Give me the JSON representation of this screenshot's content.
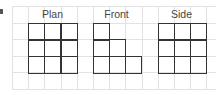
{
  "figure": {
    "marker": "i",
    "grid": {
      "columns": 12,
      "rows": 5,
      "cell_px": 16.2,
      "line_color": "#e2e2e2"
    },
    "views": [
      {
        "label": "Plan",
        "col_start": 1,
        "cells": [
          [
            0,
            0
          ],
          [
            1,
            0
          ],
          [
            2,
            0
          ],
          [
            0,
            1
          ],
          [
            1,
            1
          ],
          [
            2,
            1
          ],
          [
            0,
            2
          ],
          [
            1,
            2
          ],
          [
            2,
            2
          ]
        ]
      },
      {
        "label": "Front",
        "col_start": 5,
        "cells": [
          [
            0,
            0
          ],
          [
            0,
            1
          ],
          [
            1,
            1
          ],
          [
            0,
            2
          ],
          [
            1,
            2
          ],
          [
            2,
            2
          ]
        ]
      },
      {
        "label": "Side",
        "col_start": 9,
        "cells": [
          [
            0,
            0
          ],
          [
            1,
            0
          ],
          [
            2,
            0
          ],
          [
            0,
            1
          ],
          [
            1,
            1
          ],
          [
            2,
            1
          ],
          [
            0,
            2
          ],
          [
            1,
            2
          ],
          [
            2,
            2
          ]
        ]
      }
    ],
    "cell_border_color": "#333333"
  }
}
